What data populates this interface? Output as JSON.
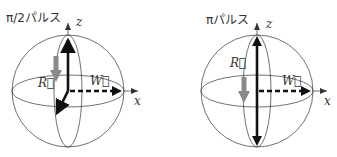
{
  "panels": [
    {
      "title": "π/2パルス",
      "axis_z": "z",
      "axis_x": "x",
      "vector_R": "R⃗",
      "vector_W": "W⃗"
    },
    {
      "title": "πパルス",
      "axis_z": "z",
      "axis_x": "x",
      "vector_R": "R⃗",
      "vector_W": "W⃗"
    }
  ],
  "colors": {
    "line": "#333333",
    "bold_arrow": "#111111",
    "R_arrow": "#8a8a8a"
  }
}
